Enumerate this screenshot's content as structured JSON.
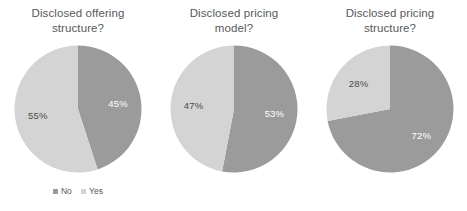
{
  "figure": {
    "background_color": "#ffffff",
    "series_colors": {
      "no": "#9b9b9b",
      "yes": "#d4d4d4"
    },
    "title_color": "#58585a",
    "label_on_dark_color": "#ffffff",
    "label_on_light_color": "#4a4a4a"
  },
  "legend": {
    "entries": [
      {
        "label": "No",
        "color": "#9b9b9b"
      },
      {
        "label": "Yes",
        "color": "#d4d4d4"
      }
    ]
  },
  "chart_data": [
    {
      "type": "pie",
      "title": "Disclosed offering\nstructure?",
      "categories": [
        "No",
        "Yes"
      ],
      "values": [
        45,
        55
      ],
      "value_labels": [
        "45%",
        "72%"
      ],
      "labels": [
        "45%",
        "55%"
      ],
      "colors": [
        "#9b9b9b",
        "#d4d4d4"
      ],
      "start_angle_deg": 0,
      "direction": "clockwise",
      "legend_position": "bottom"
    },
    {
      "type": "pie",
      "title": "Disclosed pricing\nmodel?",
      "categories": [
        "No",
        "Yes"
      ],
      "values": [
        53,
        47
      ],
      "labels": [
        "53%",
        "47%"
      ],
      "colors": [
        "#9b9b9b",
        "#d4d4d4"
      ],
      "start_angle_deg": 0,
      "direction": "clockwise",
      "legend_position": "none"
    },
    {
      "type": "pie",
      "title": "Disclosed pricing\nstructure?",
      "categories": [
        "No",
        "Yes"
      ],
      "values": [
        72,
        28
      ],
      "labels": [
        "72%",
        "28%"
      ],
      "colors": [
        "#9b9b9b",
        "#d4d4d4"
      ],
      "start_angle_deg": 0,
      "direction": "clockwise",
      "legend_position": "none"
    }
  ]
}
